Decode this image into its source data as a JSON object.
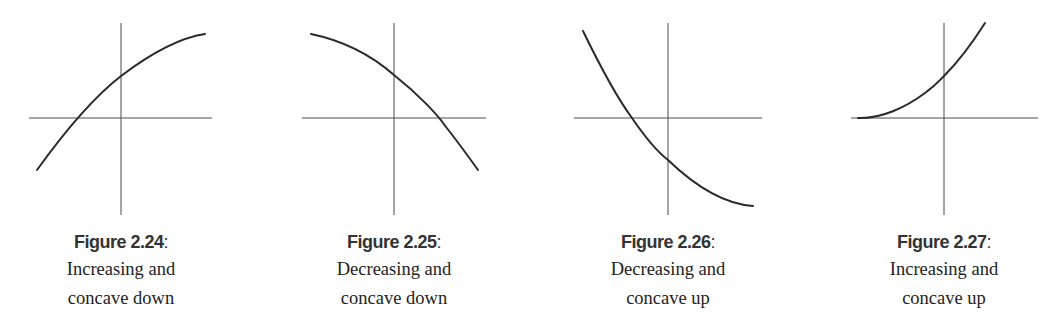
{
  "figures": [
    {
      "label": "Figure 2.24",
      "colon": ":",
      "line1": "Increasing and",
      "line2": "concave down",
      "increasing": true,
      "concavity": "down"
    },
    {
      "label": "Figure 2.25",
      "colon": ":",
      "line1": "Decreasing and",
      "line2": "concave down",
      "increasing": false,
      "concavity": "down"
    },
    {
      "label": "Figure 2.26",
      "colon": ":",
      "line1": "Decreasing and",
      "line2": "concave up",
      "increasing": false,
      "concavity": "up"
    },
    {
      "label": "Figure 2.27",
      "colon": ":",
      "line1": "Increasing and",
      "line2": "concave up",
      "increasing": true,
      "concavity": "up"
    }
  ],
  "colors": {
    "axis": "#4a4a4a",
    "curve": "#2a2a2a",
    "text": "#222222"
  }
}
